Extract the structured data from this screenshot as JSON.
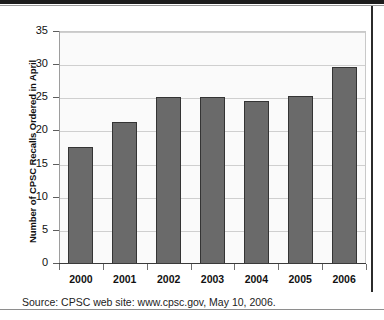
{
  "chart_data": {
    "type": "bar",
    "title": "",
    "subtitle": "",
    "xlabel": "",
    "ylabel": "Number of CPSC Recalls Ordered in April",
    "categories": [
      "2000",
      "2001",
      "2002",
      "2003",
      "2004",
      "2005",
      "2006"
    ],
    "values": [
      17.6,
      21.4,
      25.2,
      25.2,
      24.6,
      25.3,
      29.7
    ],
    "series": [
      {
        "name": "CPSC Recalls Ordered in April",
        "values": [
          17.6,
          21.4,
          25.2,
          25.2,
          24.6,
          25.3,
          29.7
        ]
      }
    ],
    "ylim": [
      0,
      35
    ],
    "ytick_labels": [
      "0",
      "5",
      "10",
      "15",
      "20",
      "25",
      "30",
      "35"
    ],
    "ytick_values": [
      0,
      5,
      10,
      15,
      20,
      25,
      30,
      35
    ],
    "grid": true,
    "legend": false,
    "legend_position": "none",
    "bar_color": "#6a6a6a",
    "bar_border_color": "#343434",
    "gridline_color": "#cfcfcf",
    "plot_background": "#fafafa",
    "axis_color": "#3a3a3a"
  },
  "caption": {
    "source_text": "Source: CPSC web site: www.cpsc.gov, May 10, 2006."
  }
}
